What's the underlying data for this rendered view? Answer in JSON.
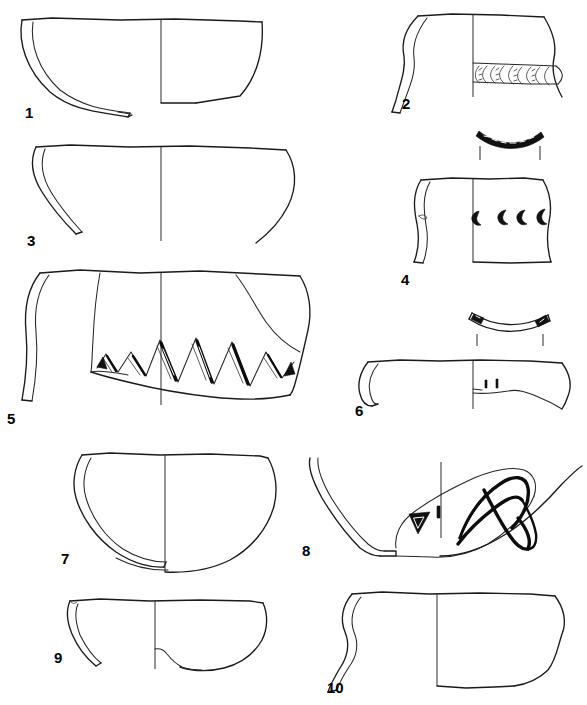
{
  "plate": {
    "title": "Archaeological pottery profile plate",
    "caption": "",
    "background_color": "#ffffff",
    "ink_color": "#1a1a1a",
    "width": 587,
    "height": 705,
    "technique": "ink line drawing, section-and-elevation convention",
    "figure_count": 10
  },
  "labels": {
    "f1": "1",
    "f2": "2",
    "f3": "3",
    "f4": "4",
    "f5": "5",
    "f6": "6",
    "f7": "7",
    "f8": "8",
    "f9": "9",
    "f10": "10"
  },
  "figures": [
    {
      "number": "1",
      "name": "open-bowl-flaring",
      "column": "left",
      "row": 1,
      "form": "large open bowl, flaring wall, simple rim",
      "decoration": "none",
      "has_section_left": true,
      "has_elevation_right": true,
      "has_rim_arc_profile": false
    },
    {
      "number": "2",
      "name": "jar-with-arc-impressed-band",
      "column": "right",
      "row": 1,
      "form": "small jar, everted rim, carinated shoulder",
      "decoration": "horizontal band of repeated arc / C-shaped impressions at carination",
      "decoration_motif_count": 7,
      "has_section_left": true,
      "has_elevation_right": true,
      "has_rim_arc_profile": false
    },
    {
      "number": "3",
      "name": "shallow-bowl-incurving",
      "column": "left",
      "row": 2,
      "form": "shallow bowl, slightly incurving wall",
      "decoration": "none",
      "has_section_left": true,
      "has_elevation_right": true,
      "has_rim_arc_profile": false
    },
    {
      "number": "4",
      "name": "jar-with-crescent-impressions",
      "column": "right",
      "row": 2,
      "form": "straight-sided jar, slightly bulging body",
      "decoration": "row of crescent / C-shaped stamped impressions on body",
      "decoration_motif_count": 4,
      "has_section_left": true,
      "has_elevation_right": true,
      "has_rim_arc_profile": true,
      "rim_arc_note": "rim-profile arc with hatched filled band, with two vertical tick guides below"
    },
    {
      "number": "5",
      "name": "jar-with-incised-zigzag",
      "column": "left",
      "row": 3,
      "form": "large jar, carinated lower body",
      "decoration": "broad incised zigzag / triangle frieze with heavy black filled strokes above base angle",
      "decoration_motif_count": 6,
      "has_section_left": true,
      "has_elevation_right": true,
      "has_rim_arc_profile": false
    },
    {
      "number": "6",
      "name": "bowl-with-punctate-ticks",
      "column": "right",
      "row": 3,
      "form": "shallow bowl, thickened rim, broken body",
      "decoration": "two small vertical impressed ticks near break edge",
      "decoration_motif_count": 2,
      "has_section_left": true,
      "has_elevation_right": true,
      "has_rim_arc_profile": true,
      "rim_arc_note": "shallow rim-profile arc with two solid-black notches, with two vertical tick guides below"
    },
    {
      "number": "7",
      "name": "deep-hemispherical-bowl",
      "column": "left",
      "row": 4,
      "form": "deep rounded bowl, simple rim, flat-to-rounded base",
      "decoration": "none",
      "has_section_left": true,
      "has_elevation_right": true,
      "has_rim_arc_profile": false
    },
    {
      "number": "8",
      "name": "shallow-dish-with-incised-zigzag",
      "column": "right",
      "row": 4,
      "form": "very shallow open dish / lamp, long flaring wall, low foot",
      "decoration": "bold incised zigzag and loop pattern on interior",
      "has_section_left": true,
      "has_elevation_right": true,
      "has_rim_arc_profile": false
    },
    {
      "number": "9",
      "name": "small-shallow-bowl",
      "column": "left",
      "row": 5,
      "form": "small shallow bowl, simple rim, irregular base",
      "decoration": "none",
      "has_section_left": true,
      "has_elevation_right": true,
      "has_rim_arc_profile": false
    },
    {
      "number": "10",
      "name": "bowl-with-sinuous-wall",
      "column": "right",
      "row": 5,
      "form": "bowl with sinuous S-profile wall, flat base",
      "decoration": "none",
      "has_section_left": true,
      "has_elevation_right": true,
      "has_rim_arc_profile": false
    }
  ]
}
